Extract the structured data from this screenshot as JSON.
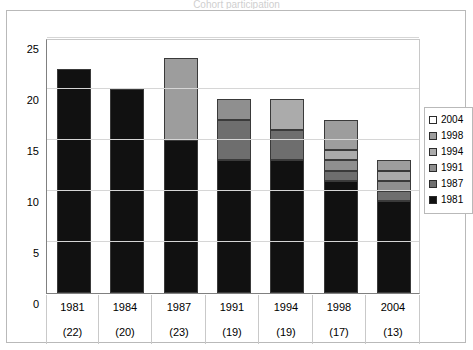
{
  "figure": {
    "clipped_title": "Cohort participation",
    "background": "#ffffff",
    "frame_color": "#b9b9b9"
  },
  "chart_data": {
    "type": "bar",
    "subtype": "stacked",
    "title": "",
    "xlabel": "",
    "ylabel": "",
    "ylim": [
      0,
      25
    ],
    "ytick_values": [
      0,
      5,
      10,
      15,
      20,
      25
    ],
    "ytick_labels": [
      "0",
      "5",
      "10",
      "15",
      "20",
      "25"
    ],
    "grid": true,
    "grid_axis": "y",
    "legend_position": "right",
    "categories": [
      "1981",
      "1984",
      "1987",
      "1991",
      "1994",
      "1998",
      "2004"
    ],
    "category_sublabels": [
      "(22)",
      "(20)",
      "(23)",
      "(19)",
      "(19)",
      "(17)",
      "(13)"
    ],
    "totals": [
      22,
      20,
      23,
      19,
      19,
      17,
      13
    ],
    "series": [
      {
        "name": "1981",
        "color": "#111111",
        "values": [
          22,
          20,
          15,
          13,
          13,
          11,
          9
        ]
      },
      {
        "name": "1987",
        "color": "#6e6e6e",
        "values": [
          0,
          0,
          0,
          4,
          3,
          1,
          1
        ]
      },
      {
        "name": "1991",
        "color": "#8f8f8f",
        "values": [
          0,
          0,
          0,
          2,
          0,
          1,
          1
        ]
      },
      {
        "name": "1994",
        "color": "#ababab",
        "values": [
          0,
          0,
          0,
          0,
          3,
          1,
          1
        ]
      },
      {
        "name": "1998",
        "color": "#9d9d9d",
        "values": [
          0,
          0,
          8,
          0,
          0,
          3,
          1
        ]
      },
      {
        "name": "2004",
        "color": "#ffffff",
        "values": [
          0,
          0,
          0,
          0,
          0,
          0,
          0
        ]
      }
    ],
    "legend_entries": [
      {
        "label": "2004",
        "color": "#ffffff"
      },
      {
        "label": "1998",
        "color": "#9d9d9d"
      },
      {
        "label": "1994",
        "color": "#ababab"
      },
      {
        "label": "1991",
        "color": "#8f8f8f"
      },
      {
        "label": "1987",
        "color": "#6e6e6e"
      },
      {
        "label": "1981",
        "color": "#111111"
      }
    ]
  }
}
